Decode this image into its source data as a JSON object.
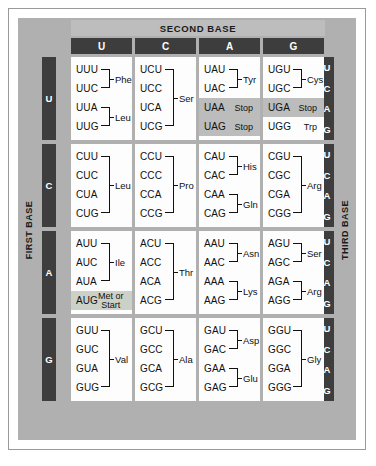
{
  "figure": {
    "axis_labels": {
      "second_base": "SECOND BASE",
      "first_base": "FIRST BASE",
      "third_base": "THIRD BASE"
    },
    "column_headers": [
      "U",
      "C",
      "A",
      "G"
    ],
    "row_headers": [
      "U",
      "C",
      "A",
      "G"
    ],
    "third_base_letters": [
      "U",
      "C",
      "A",
      "G"
    ],
    "colors": {
      "plate": "#b0b0b0",
      "header_band": "#bdbdbd",
      "header_chip": "#3d3d3d",
      "cell": "#fdfdfd",
      "stop_highlight": "#bcbcbc",
      "start_highlight": "#ccd1c7",
      "text": "#111111"
    }
  },
  "chart_data": {
    "type": "table",
    "xlabel": "SECOND BASE",
    "ylabel": "FIRST BASE",
    "zlabel": "THIRD BASE",
    "categories": [
      "U",
      "C",
      "A",
      "G"
    ],
    "cells": [
      {
        "first": "U",
        "second": "U",
        "codons": [
          "UUU",
          "UUC",
          "UUA",
          "UUG"
        ],
        "groups": [
          {
            "span": [
              0,
              1
            ],
            "amino_acid": "Phe"
          },
          {
            "span": [
              2,
              3
            ],
            "amino_acid": "Leu"
          }
        ]
      },
      {
        "first": "U",
        "second": "C",
        "codons": [
          "UCU",
          "UCC",
          "UCA",
          "UCG"
        ],
        "groups": [
          {
            "span": [
              0,
              3
            ],
            "amino_acid": "Ser"
          }
        ]
      },
      {
        "first": "U",
        "second": "A",
        "codons": [
          "UAU",
          "UAC",
          "UAA",
          "UAG"
        ],
        "groups": [
          {
            "span": [
              0,
              1
            ],
            "amino_acid": "Tyr"
          }
        ],
        "inline": [
          {
            "index": 2,
            "label": "Stop",
            "highlight": "stop"
          },
          {
            "index": 3,
            "label": "Stop",
            "highlight": "stop"
          }
        ]
      },
      {
        "first": "U",
        "second": "G",
        "codons": [
          "UGU",
          "UGC",
          "UGA",
          "UGG"
        ],
        "groups": [
          {
            "span": [
              0,
              1
            ],
            "amino_acid": "Cys"
          }
        ],
        "inline": [
          {
            "index": 2,
            "label": "Stop",
            "highlight": "stop"
          },
          {
            "index": 3,
            "label": "Trp",
            "highlight": "none"
          }
        ]
      },
      {
        "first": "C",
        "second": "U",
        "codons": [
          "CUU",
          "CUC",
          "CUA",
          "CUG"
        ],
        "groups": [
          {
            "span": [
              0,
              3
            ],
            "amino_acid": "Leu"
          }
        ]
      },
      {
        "first": "C",
        "second": "C",
        "codons": [
          "CCU",
          "CCC",
          "CCA",
          "CCG"
        ],
        "groups": [
          {
            "span": [
              0,
              3
            ],
            "amino_acid": "Pro"
          }
        ]
      },
      {
        "first": "C",
        "second": "A",
        "codons": [
          "CAU",
          "CAC",
          "CAA",
          "CAG"
        ],
        "groups": [
          {
            "span": [
              0,
              1
            ],
            "amino_acid": "His"
          },
          {
            "span": [
              2,
              3
            ],
            "amino_acid": "Gln"
          }
        ]
      },
      {
        "first": "C",
        "second": "G",
        "codons": [
          "CGU",
          "CGC",
          "CGA",
          "CGG"
        ],
        "groups": [
          {
            "span": [
              0,
              3
            ],
            "amino_acid": "Arg"
          }
        ]
      },
      {
        "first": "A",
        "second": "U",
        "codons": [
          "AUU",
          "AUC",
          "AUA",
          "AUG"
        ],
        "groups": [
          {
            "span": [
              0,
              2
            ],
            "amino_acid": "Ile"
          }
        ],
        "inline": [
          {
            "index": 3,
            "label": "Met or Start",
            "highlight": "start"
          }
        ]
      },
      {
        "first": "A",
        "second": "C",
        "codons": [
          "ACU",
          "ACC",
          "ACA",
          "ACG"
        ],
        "groups": [
          {
            "span": [
              0,
              3
            ],
            "amino_acid": "Thr"
          }
        ]
      },
      {
        "first": "A",
        "second": "A",
        "codons": [
          "AAU",
          "AAC",
          "AAA",
          "AAG"
        ],
        "groups": [
          {
            "span": [
              0,
              1
            ],
            "amino_acid": "Asn"
          },
          {
            "span": [
              2,
              3
            ],
            "amino_acid": "Lys"
          }
        ]
      },
      {
        "first": "A",
        "second": "G",
        "codons": [
          "AGU",
          "AGC",
          "AGA",
          "AGG"
        ],
        "groups": [
          {
            "span": [
              0,
              1
            ],
            "amino_acid": "Ser"
          },
          {
            "span": [
              2,
              3
            ],
            "amino_acid": "Arg"
          }
        ]
      },
      {
        "first": "G",
        "second": "U",
        "codons": [
          "GUU",
          "GUC",
          "GUA",
          "GUG"
        ],
        "groups": [
          {
            "span": [
              0,
              3
            ],
            "amino_acid": "Val"
          }
        ]
      },
      {
        "first": "G",
        "second": "C",
        "codons": [
          "GCU",
          "GCC",
          "GCA",
          "GCG"
        ],
        "groups": [
          {
            "span": [
              0,
              3
            ],
            "amino_acid": "Ala"
          }
        ]
      },
      {
        "first": "G",
        "second": "A",
        "codons": [
          "GAU",
          "GAC",
          "GAA",
          "GAG"
        ],
        "groups": [
          {
            "span": [
              0,
              1
            ],
            "amino_acid": "Asp"
          },
          {
            "span": [
              2,
              3
            ],
            "amino_acid": "Glu"
          }
        ]
      },
      {
        "first": "G",
        "second": "G",
        "codons": [
          "GGU",
          "GGC",
          "GGA",
          "GGG"
        ],
        "groups": [
          {
            "span": [
              0,
              3
            ],
            "amino_acid": "Gly"
          }
        ]
      }
    ]
  }
}
